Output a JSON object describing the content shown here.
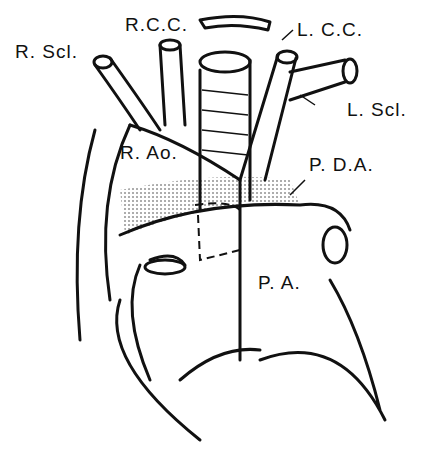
{
  "figure": {
    "labels": {
      "r_scl": "R. Scl.",
      "r_cc": "R.C.C.",
      "l_cc": "L. C.C.",
      "l_scl": "L. Scl.",
      "r_ao": "R. Ao.",
      "pda": "P. D.A.",
      "pa": "P. A."
    }
  }
}
